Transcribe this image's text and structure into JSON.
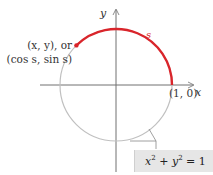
{
  "diagram": {
    "type": "unit-circle",
    "colors": {
      "arc": "#d9252b",
      "circle": "#c0c0c0",
      "axes": "#707070",
      "equation_box": "#e6e6e6"
    },
    "labels": {
      "y_axis": "y",
      "x_axis": "x",
      "point_line1": "(x, y), or",
      "point_line2": "(cos s, sin s)",
      "arc_length": "s",
      "unit_point": "(1, 0)",
      "equation_lhs_x": "x",
      "equation_exp": "2",
      "equation_plus": " + ",
      "equation_lhs_y": "y",
      "equation_rhs": " = 1"
    }
  }
}
